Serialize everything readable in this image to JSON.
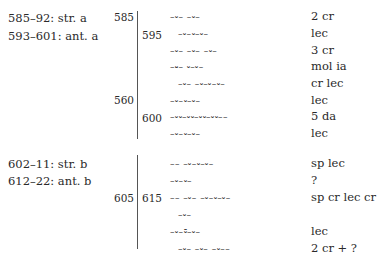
{
  "section_a": {
    "labels": [
      "585–92: str. a",
      "593–601: ant. a"
    ],
    "line_numbers": {
      "l1": "585",
      "r1": "595",
      "l2": "560",
      "r2": "600"
    },
    "rows": [
      {
        "scansion": "–⏑– –⏑–",
        "meter": "2 cr"
      },
      {
        "scansion": "–⏑–⏑–⏑–",
        "meter": "lec"
      },
      {
        "scansion": "–⏑– –⏑– –⏑–",
        "meter": "3 cr"
      },
      {
        "scansion": "–⏓– ⏑–⏑–",
        "meter": "mol ia"
      },
      {
        "scansion": "–⏑– –⏑–⏑–⏑–",
        "meter": "cr lec"
      },
      {
        "scansion": "–⏑–⏑–⏑–",
        "meter": "lec"
      },
      {
        "scansion": "–⏑⏑–⏑⏑–⏑⏑–⏑⏑––",
        "meter": "5 da"
      },
      {
        "scansion": "–⏑–⏑–⏑–",
        "meter": "lec"
      }
    ]
  },
  "section_b": {
    "labels": [
      "602–11: str. b",
      "612–22: ant. b"
    ],
    "line_numbers": {
      "l1": "605",
      "r1": "615"
    },
    "rows": [
      {
        "scansion": "–– –⏑–⏑–⏑–",
        "meter": "sp lec"
      },
      {
        "scansion": "–⏑–⏑–",
        "meter": "?"
      },
      {
        "scansion": "–– –⏑– –⏑–⏑–⏑–",
        "meter": "sp cr lec cr"
      },
      {
        "scansion": "–⏑–",
        "meter": ""
      },
      {
        "scansion": "–⏑–⏒–⏑–",
        "meter": "lec"
      },
      {
        "scansion": "–⏑– –⏑– –⏑––",
        "meter": "2 cr + ?"
      }
    ]
  }
}
